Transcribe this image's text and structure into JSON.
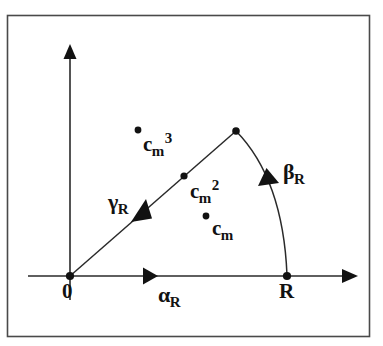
{
  "figure": {
    "type": "geometric-diagram",
    "caption_present": false,
    "background_color": "#ffffff",
    "stroke_color": "#1a1a1a",
    "frame": {
      "name": "figure-border",
      "x": 7,
      "y": 15,
      "width": 363,
      "height": 322
    },
    "axes": {
      "x_axis": {
        "label": "",
        "from": [
          28,
          276
        ],
        "to": [
          357,
          276
        ],
        "arrow": "right"
      },
      "y_axis": {
        "label": "",
        "from": [
          70,
          300
        ],
        "to": [
          70,
          46
        ],
        "arrow": "up"
      },
      "origin": [
        70,
        276
      ]
    },
    "points": [
      {
        "id": "origin",
        "label": "0",
        "x": 70,
        "y": 276,
        "label_x": 62,
        "label_y": 281,
        "marker": true
      },
      {
        "id": "R",
        "label": "R",
        "x": 287,
        "y": 276,
        "label_x": 280,
        "label_y": 281,
        "marker": true
      },
      {
        "id": "apex",
        "label": "",
        "x": 236,
        "y": 131,
        "marker": true
      },
      {
        "id": "cm2",
        "label": "",
        "x": 184,
        "y": 176,
        "marker": true
      },
      {
        "id": "cm3",
        "label": "",
        "x": 138,
        "y": 130,
        "marker": true
      },
      {
        "id": "cm",
        "label": "",
        "x": 206,
        "y": 216,
        "marker": true
      }
    ],
    "curves": [
      {
        "id": "gamma-segment",
        "name": "gamma-line",
        "from": [
          70,
          276
        ],
        "to": [
          236,
          131
        ],
        "kind": "line"
      },
      {
        "id": "beta-arc",
        "name": "beta-arc",
        "from": [
          236,
          131
        ],
        "to": [
          287,
          276
        ],
        "control": [
          283,
          180
        ],
        "kind": "quadratic-curve"
      }
    ],
    "arrows": [
      {
        "id": "alpha-arrow",
        "x": 152,
        "y": 276,
        "direction": "right"
      },
      {
        "id": "gamma-arrow",
        "x": 147,
        "y": 212,
        "direction": "down-left"
      },
      {
        "id": "beta-arrow",
        "x": 266,
        "y": 181,
        "direction": "up-left"
      },
      {
        "id": "x-axis-arrow",
        "x": 357,
        "y": 276,
        "direction": "right"
      },
      {
        "id": "y-axis-arrow",
        "x": 70,
        "y": 46,
        "direction": "up"
      }
    ],
    "labels": [
      {
        "id": "alpha-R",
        "name": "alpha-R-label",
        "base": "α",
        "sub": "R",
        "sup": "",
        "x": 158,
        "y": 284,
        "style": "greek"
      },
      {
        "id": "beta-R",
        "name": "beta-R-label",
        "base": "β",
        "sub": "R",
        "sup": "",
        "x": 283,
        "y": 161,
        "style": "greek"
      },
      {
        "id": "gamma-R",
        "name": "gamma-R-label",
        "base": "γ",
        "sub": "R",
        "sup": "",
        "x": 108,
        "y": 191,
        "style": "greek"
      },
      {
        "id": "c-m-3",
        "name": "c-m-cubed-label",
        "base": "c",
        "sub": "m",
        "sup": "3",
        "x": 143,
        "y": 131,
        "style": "latin"
      },
      {
        "id": "c-m-2",
        "name": "c-m-squared-label",
        "base": "c",
        "sub": "m",
        "sup": "2",
        "x": 190,
        "y": 178,
        "style": "latin"
      },
      {
        "id": "c-m",
        "name": "c-m-label",
        "base": "c",
        "sub": "m",
        "sup": "",
        "x": 212,
        "y": 218,
        "style": "latin"
      }
    ],
    "origin_label": "0",
    "r_label": "R"
  }
}
